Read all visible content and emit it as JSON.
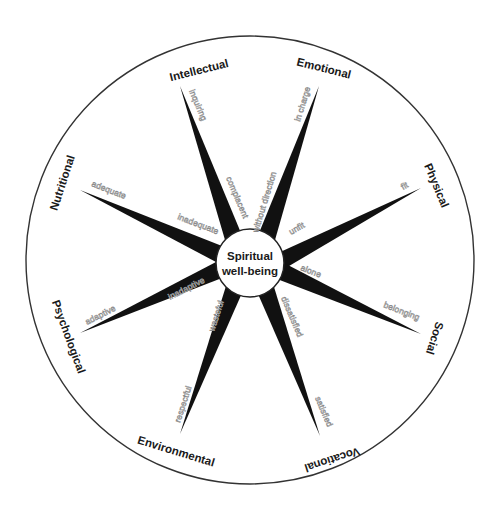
{
  "diagram": {
    "center_label_line1": "Spiritual",
    "center_label_line2": "well-being",
    "colors": {
      "spoke": "#111111",
      "outline": "#333333",
      "pole_text": "#8a8a8a",
      "background": "#ffffff"
    },
    "dimensions": [
      {
        "id": "intellectual",
        "label": "Intellectual",
        "outer_pole": "inquiring",
        "inner_pole": "complacent"
      },
      {
        "id": "emotional",
        "label": "Emotional",
        "outer_pole": "in charge",
        "inner_pole": "without direction"
      },
      {
        "id": "physical",
        "label": "Physical",
        "outer_pole": "fit",
        "inner_pole": "unfit"
      },
      {
        "id": "social",
        "label": "Social",
        "outer_pole": "belonging",
        "inner_pole": "alone"
      },
      {
        "id": "vocational",
        "label": "Vocational",
        "outer_pole": "satisfied",
        "inner_pole": "dissatisfied"
      },
      {
        "id": "environmental",
        "label": "Environmental",
        "outer_pole": "respectful",
        "inner_pole": "wasteful"
      },
      {
        "id": "psychological",
        "label": "Psychological",
        "outer_pole": "adaptive",
        "inner_pole": "inadaptive"
      },
      {
        "id": "nutritional",
        "label": "Nutritional",
        "outer_pole": "adequate",
        "inner_pole": "inadequate"
      }
    ]
  }
}
